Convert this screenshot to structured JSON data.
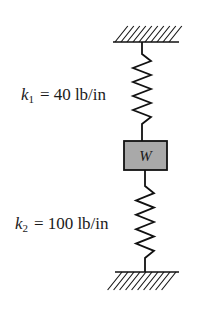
{
  "diagram": {
    "type": "spring-mass-system",
    "top_support": "fixed-ground",
    "bottom_support": "fixed-ground",
    "mass": {
      "label": "W",
      "fill_color": "#a9a9a9"
    },
    "springs": [
      {
        "name": "k",
        "subscript": "1",
        "equals": "=",
        "value": "40 lb/in"
      },
      {
        "name": "k",
        "subscript": "2",
        "equals": "=",
        "value": "100 lb/in"
      }
    ],
    "line_color": "#111111"
  }
}
